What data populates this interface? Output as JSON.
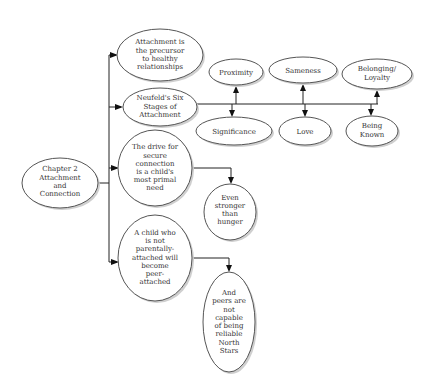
{
  "diagram": {
    "root": {
      "lines": [
        "Chapter 2",
        "Attachment",
        "and",
        "Connection"
      ]
    },
    "branches": [
      {
        "lines": [
          "Attachment is",
          "the precursor",
          "to healthy",
          "relationships"
        ]
      },
      {
        "lines": [
          "Neufeld's Six",
          "Stages of",
          "Attachment"
        ]
      },
      {
        "lines": [
          "The drive for",
          "secure",
          "connection",
          "is a child's",
          "most primal",
          "need"
        ]
      },
      {
        "lines": [
          "A child who",
          "is not",
          "parentally-",
          "attached will",
          "become",
          "peer-",
          "attached"
        ]
      }
    ],
    "stages": [
      {
        "lines": [
          "Proximity"
        ]
      },
      {
        "lines": [
          "Sameness"
        ]
      },
      {
        "lines": [
          "Belonging/",
          "Loyalty"
        ]
      },
      {
        "lines": [
          "Significance"
        ]
      },
      {
        "lines": [
          "Love"
        ]
      },
      {
        "lines": [
          "Being",
          "Known"
        ]
      }
    ],
    "sub_nodes": [
      {
        "lines": [
          "Even",
          "stronger",
          "than",
          "hunger"
        ]
      },
      {
        "lines": [
          "And",
          "peers are",
          "not",
          "capable",
          "of being",
          "reliable",
          "North",
          "Stars"
        ]
      }
    ]
  }
}
